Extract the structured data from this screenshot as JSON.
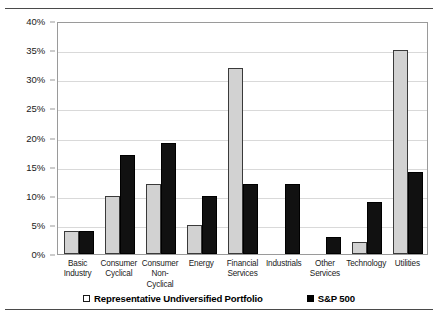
{
  "chart_data": {
    "type": "bar",
    "title": "",
    "xlabel": "",
    "ylabel": "",
    "ylim": [
      0,
      40
    ],
    "ytick_step": 5,
    "grid": true,
    "legend_position": "bottom-center",
    "categories": [
      "Basic Industry",
      "Consumer Cyclical",
      "Consumer Non-Cyclical",
      "Energy",
      "Financial Services",
      "Industrials",
      "Other Services",
      "Technology",
      "Utilities"
    ],
    "category_lines": [
      [
        "Basic",
        "Industry"
      ],
      [
        "Consumer",
        "Cyclical"
      ],
      [
        "Consumer",
        "Non-Cyclical"
      ],
      [
        "Energy",
        ""
      ],
      [
        "Financial",
        "Services"
      ],
      [
        "Industrials",
        ""
      ],
      [
        "Other",
        "Services"
      ],
      [
        "Technology",
        ""
      ],
      [
        "Utilities",
        ""
      ]
    ],
    "ytick_labels": [
      "0%",
      "5%",
      "10%",
      "15%",
      "20%",
      "25%",
      "30%",
      "35%",
      "40%"
    ],
    "ytick_values": [
      0,
      5,
      10,
      15,
      20,
      25,
      30,
      35,
      40
    ],
    "series": [
      {
        "name": "Representative Undiversified Portfolio",
        "color": "#d2d2d2",
        "values": [
          4,
          10,
          12,
          5,
          32,
          0,
          0,
          2,
          35
        ]
      },
      {
        "name": "S&P 500",
        "color": "#111111",
        "values": [
          4,
          17,
          19,
          10,
          12,
          12,
          3,
          9,
          14
        ]
      }
    ]
  },
  "legend": {
    "entries": [
      {
        "label": "Representative Undiversified Portfolio",
        "marker": "light-square-icon"
      },
      {
        "label": "S&P 500",
        "marker": "black-square-icon"
      }
    ]
  }
}
